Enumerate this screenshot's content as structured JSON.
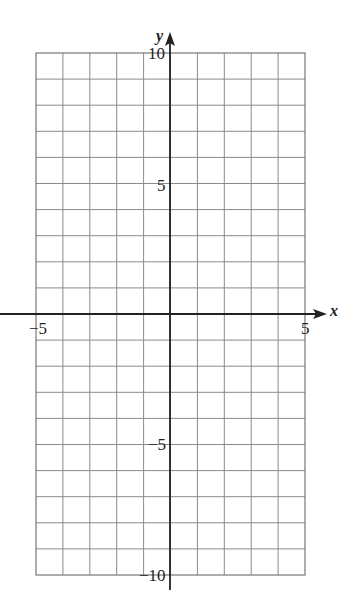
{
  "chart_data": {
    "type": "scatter",
    "title": "",
    "xlabel": "x",
    "ylabel": "y",
    "xlim": [
      -5,
      5
    ],
    "ylim": [
      -10,
      10
    ],
    "grid": true,
    "x_gridstep": 1,
    "y_gridstep": 1,
    "x_tick_labels": [
      "-5",
      "5"
    ],
    "y_tick_labels": [
      "10",
      "5",
      "-5",
      "-10"
    ],
    "series": []
  },
  "labels": {
    "x_axis": "x",
    "y_axis": "y",
    "x_min": "−5",
    "x_max": "5",
    "y_max": "10",
    "y_mid_pos": "5",
    "y_mid_neg": "−5",
    "y_min": "−10"
  },
  "colors": {
    "grid": "#8a8a8a",
    "axis": "#222222",
    "border": "#777777"
  }
}
